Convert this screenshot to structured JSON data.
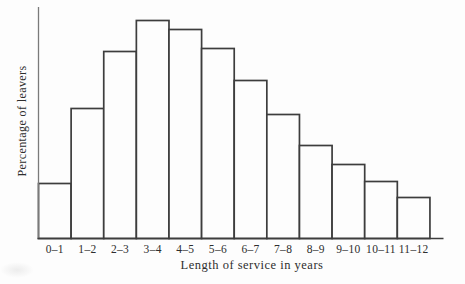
{
  "figure": {
    "background": "#fdfdfd",
    "bar_line_color": "#3d3d3d",
    "axis_line_color": "#7a7a7a",
    "text_color": "#2e2e2e"
  },
  "chart_data": {
    "type": "bar",
    "subtype": "histogram",
    "title": "",
    "xlabel": "Length of service in years",
    "ylabel": "Percentage of leavers",
    "categories": [
      "0–1",
      "1–2",
      "2–3",
      "3–4",
      "4–5",
      "5–6",
      "6–7",
      "7–8",
      "8–9",
      "9–10",
      "10–11",
      "11–12"
    ],
    "values_pct_estimated": [
      3.6,
      8.5,
      12.2,
      14.2,
      13.6,
      12.4,
      10.3,
      8.1,
      6.1,
      4.8,
      3.7,
      2.7
    ],
    "bar_heights_px": [
      55,
      130,
      187,
      218,
      209,
      190,
      158,
      124,
      93,
      74,
      57,
      41
    ],
    "y_tick_labels": [],
    "gridlines": false,
    "legend": null,
    "bar_fill": "none"
  }
}
